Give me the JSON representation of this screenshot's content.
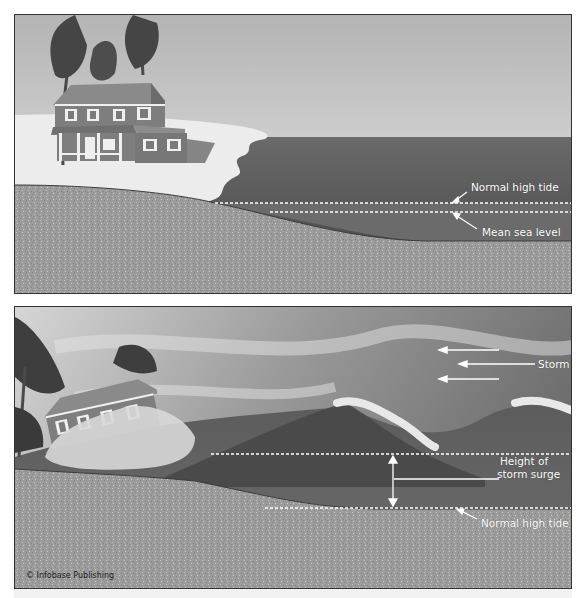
{
  "diagram": {
    "panels": [
      {
        "id": "normal-conditions",
        "labels": {
          "normal_high_tide": "Normal high tide",
          "mean_sea_level": "Mean sea level"
        }
      },
      {
        "id": "storm-conditions",
        "labels": {
          "storm": "Storm",
          "height_of_storm_surge_line1": "Height of",
          "height_of_storm_surge_line2": "storm surge",
          "normal_high_tide": "Normal high tide"
        }
      }
    ],
    "copyright": "© Infobase Publishing",
    "colors": {
      "sky_top": "#bdbdbd",
      "sky_bottom": "#e9e9e9",
      "sea": "#5a5a5a",
      "sand_beach": "#ececec",
      "ground": "#9a9a9a",
      "house_wall": "#7e7e7e",
      "house_trim": "#f0f0f0",
      "label_text": "#ffffff",
      "border": "#333333"
    }
  }
}
